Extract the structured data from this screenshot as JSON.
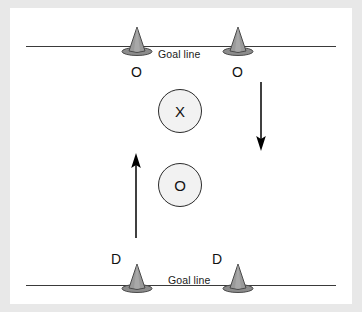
{
  "diagram": {
    "colors": {
      "panel_background": "#ffffff",
      "page_background": "#e8e8e8",
      "cone_fill": "#8c8c8c",
      "cone_stroke": "#4a4a4a",
      "line_color": "#3a3a3a",
      "marker_fill": "#f2f2f2",
      "marker_stroke": "#2b2b2b",
      "arrow_color": "#000000"
    },
    "goal_lines": [
      {
        "id": "top",
        "label": "Goal line"
      },
      {
        "id": "bottom",
        "label": "Goal line"
      }
    ],
    "cones": [
      {
        "id": "top-left",
        "label": "O"
      },
      {
        "id": "top-right",
        "label": "O"
      },
      {
        "id": "bottom-left",
        "label": "D"
      },
      {
        "id": "bottom-right",
        "label": "D"
      }
    ],
    "markers": [
      {
        "id": "attacker",
        "label": "X"
      },
      {
        "id": "defender",
        "label": "O"
      }
    ],
    "arrows": [
      {
        "id": "down-arrow",
        "direction": "down"
      },
      {
        "id": "up-arrow",
        "direction": "up"
      }
    ]
  }
}
